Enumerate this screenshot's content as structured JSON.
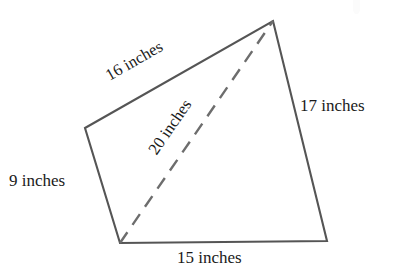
{
  "figure": {
    "type": "geometry-diagram",
    "shape": "quadrilateral",
    "background_color": "#ffffff",
    "stroke_color": "#555555",
    "text_color": "#1a1a1a",
    "vertices": {
      "top": [
        273,
        21
      ],
      "left": [
        85,
        128
      ],
      "bottom_left": [
        120,
        243
      ],
      "bottom_right": [
        327,
        241
      ]
    },
    "edges": [
      {
        "name": "top-left-edge",
        "from": "left",
        "to": "top",
        "style": "solid",
        "label": "16 inches"
      },
      {
        "name": "right-edge",
        "from": "top",
        "to": "bottom_right",
        "style": "solid",
        "label": "17 inches"
      },
      {
        "name": "bottom-edge",
        "from": "bottom_right",
        "to": "bottom_left",
        "style": "solid",
        "label": "15 inches"
      },
      {
        "name": "left-edge",
        "from": "bottom_left",
        "to": "left",
        "style": "solid",
        "label": "9 inches"
      },
      {
        "name": "diagonal",
        "from": "bottom_left",
        "to": "top",
        "style": "dashed",
        "label": "20 inches"
      }
    ],
    "labels": {
      "top_side": "16 inches",
      "diagonal": "20 inches",
      "right_side": "17 inches",
      "left_side": "9 inches",
      "bottom_side": "15 inches"
    }
  }
}
